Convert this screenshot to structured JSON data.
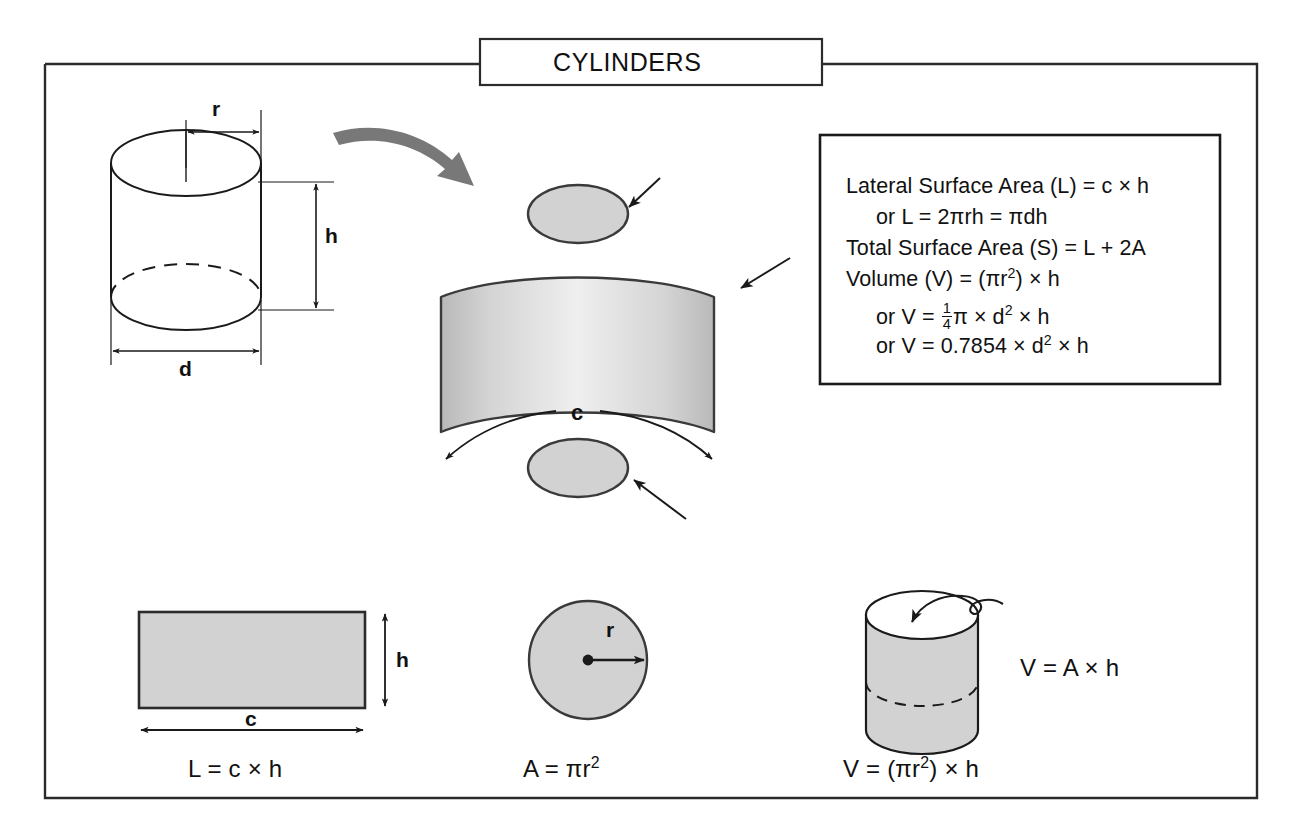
{
  "page": {
    "title": "CYLINDERS",
    "background_color": "#ffffff",
    "line_color": "#1a1a1a",
    "fill_gray": "#d2d2d2",
    "band_gray_edge": "#bdbdbd",
    "band_gray_center": "#ededed",
    "arrow_gray": "#787878"
  },
  "formula_box": {
    "lines": [
      {
        "id": "lateral-surface-area",
        "text": "Lateral Surface Area (L) = c × h",
        "indent": false
      },
      {
        "id": "lateral-alt",
        "text": "or L = 2πrh = πdh",
        "indent": true
      },
      {
        "id": "total-surface-area",
        "text": "Total Surface Area (S) = L + 2A",
        "indent": false
      },
      {
        "id": "volume",
        "text": "Volume (V) = (πr²) × h",
        "indent": false
      },
      {
        "id": "volume-alt-fraction",
        "text": "or V = ¼π × d² × h",
        "indent": true
      },
      {
        "id": "volume-alt-decimal",
        "text": "or V = 0.7854 × d² × h",
        "indent": true
      }
    ]
  },
  "cylinder_dimensions": {
    "radius_label": "r",
    "height_label": "h",
    "diameter_label": "d"
  },
  "exploded_view": {
    "circumference_label": "c",
    "top_cap_name": "top circular cap",
    "bottom_cap_name": "bottom circular cap",
    "band_name": "unrolled lateral surface"
  },
  "bottom_figures": [
    {
      "id": "lateral-surface",
      "shape": "rectangle",
      "caption": "L = c × h",
      "dim_width_label": "c",
      "dim_height_label": "h"
    },
    {
      "id": "base-area",
      "shape": "circle",
      "caption": "A = πr²",
      "radius_label": "r"
    },
    {
      "id": "volume",
      "shape": "cylinder",
      "caption": "V = (πr²) × h",
      "side_caption": "V = A × h"
    }
  ]
}
